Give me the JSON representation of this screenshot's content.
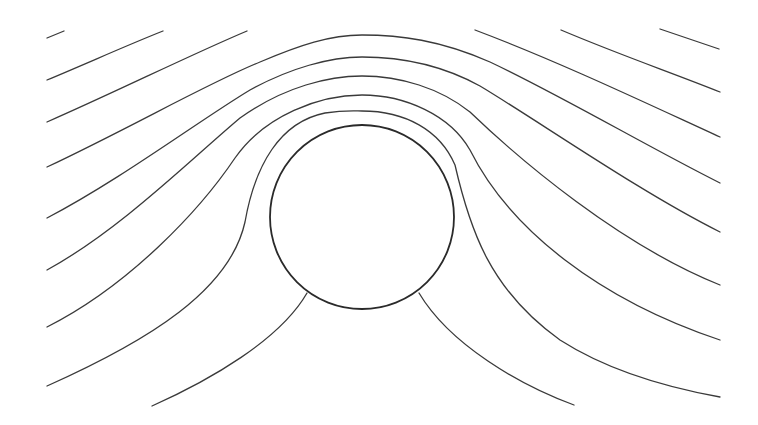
{
  "diagram": {
    "type": "streamlines-around-cylinder",
    "canvas": {
      "width": 758,
      "height": 425,
      "background": "#ffffff"
    },
    "colors": {
      "stroke": "#3a3a3a",
      "cylinder_stroke": "#2a2a2a"
    },
    "cylinder": {
      "cx": 362,
      "cy": 217,
      "r": 92
    },
    "streamlines": [
      {
        "id": "L0a",
        "d": "M47,38 L64,31"
      },
      {
        "id": "L0b",
        "d": "M660,29 L719,49"
      },
      {
        "id": "L1a",
        "d": "M47,80 C90,62 130,44 163,31"
      },
      {
        "id": "L1b",
        "d": "M561,30 C620,55 670,72 720,92"
      },
      {
        "id": "L2a",
        "d": "M47,122 C120,90 190,55 247,31"
      },
      {
        "id": "L2b",
        "d": "M475,30 C560,62 650,105 720,137"
      },
      {
        "id": "L3",
        "d": "M47,167 C130,128 210,82 260,62 C300,45 330,35 362,35 C400,35 440,40 490,62 C560,95 650,148 720,183"
      },
      {
        "id": "L4",
        "d": "M47,218 C120,180 200,120 250,90 C290,68 330,57 362,57 C400,57 440,64 480,86 C540,122 640,192 720,232"
      },
      {
        "id": "L5",
        "d": "M47,270 C120,230 190,160 240,118 C285,86 330,76 362,76 C400,76 440,88 470,112 C520,160 620,245 720,285"
      },
      {
        "id": "L6",
        "d": "M47,327 C130,285 200,210 235,158 C265,115 320,95 362,95 C405,95 450,115 470,150 C510,230 600,300 720,340"
      },
      {
        "id": "L7",
        "d": "M47,386 C150,340 230,290 245,222 C255,165 280,122 325,113 C345,110 355,111 362,111 C405,111 440,130 455,165 C470,230 490,290 560,340 C610,372 670,388 720,397"
      },
      {
        "id": "L8a",
        "d": "M152,406 C210,380 280,340 307,293"
      },
      {
        "id": "L8b",
        "d": "M419,293 C450,345 520,385 574,405"
      }
    ]
  }
}
